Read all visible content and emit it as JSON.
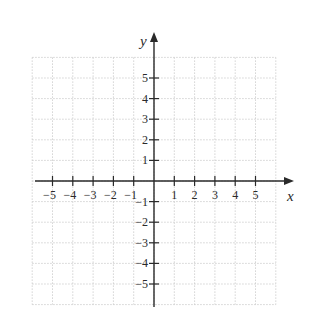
{
  "chart_data": {
    "type": "scatter",
    "title": "",
    "xlabel": "x",
    "ylabel": "y",
    "xlim": [
      -6,
      6
    ],
    "ylim": [
      -6,
      6
    ],
    "grid": true,
    "grid_style": "dotted",
    "x_ticks": [
      -5,
      -4,
      -3,
      -2,
      -1,
      1,
      2,
      3,
      4,
      5
    ],
    "y_ticks": [
      -5,
      -4,
      -3,
      -2,
      -1,
      1,
      2,
      3,
      4,
      5
    ],
    "x_tick_labels": [
      "−5",
      "−4",
      "−3",
      "−2",
      "−1",
      "1",
      "2",
      "3",
      "4",
      "5"
    ],
    "y_tick_labels": [
      "−5",
      "−4",
      "−3",
      "−2",
      "−1",
      "1",
      "2",
      "3",
      "4",
      "5"
    ],
    "series": [],
    "legend": null
  },
  "colors": {
    "axis": "#2a2a2a",
    "grid": "#c8c8c8",
    "background": "#ffffff"
  }
}
